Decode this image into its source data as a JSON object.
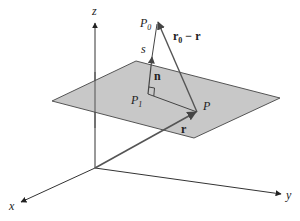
{
  "diagram": {
    "axes": {
      "x_label": "x",
      "y_label": "y",
      "z_label": "z"
    },
    "points": {
      "P0": {
        "label": "P",
        "subscript": "0"
      },
      "P1": {
        "label": "P",
        "subscript": "1"
      },
      "P": {
        "label": "P"
      }
    },
    "vectors": {
      "n": {
        "label": "n"
      },
      "r": {
        "label": "r"
      },
      "r0_minus_r": {
        "label_main": "r",
        "label_sub": "0",
        "label_rest": " − r"
      }
    },
    "distance_label": "s",
    "colors": {
      "plane_fill": "#c8c8c8",
      "plane_stroke": "#555555",
      "axis_stroke": "#333333",
      "vector_stroke": "#555555"
    }
  }
}
